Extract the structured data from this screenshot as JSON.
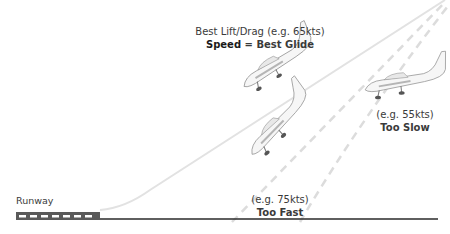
{
  "diagram": {
    "runway_label": "Runway",
    "best_glide": {
      "line1": "Best Lift/Drag (e.g. 65kts)",
      "line2_bold_left": "Speed",
      "line2_sep": " = ",
      "line2_bold_right": "Best Glide"
    },
    "too_slow": {
      "speed": "(e.g. 55kts)",
      "label": "Too Slow"
    },
    "too_fast": {
      "speed": "(e.g. 75kts)",
      "label": "Too Fast"
    },
    "colors": {
      "glide_path": "#e3e3e3",
      "dashed_path": "#dedede",
      "ground": "#2a2a2a",
      "runway": "#5a5a5a",
      "runway_marks": "#ffffff",
      "text": "#3a3a3a"
    }
  }
}
